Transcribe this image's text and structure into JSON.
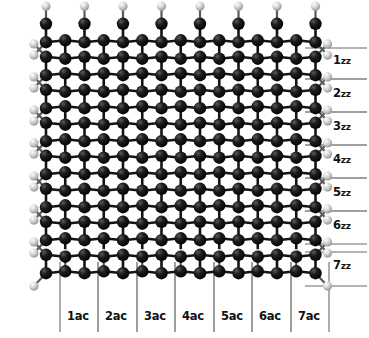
{
  "figure": {
    "type": "molecular-structure-diagram",
    "background_color": "#ffffff"
  },
  "colors": {
    "carbon": "#0a0a0a",
    "carbon_highlight": "#6e6e6e",
    "hydrogen": "#d9d9d9",
    "hydrogen_highlight": "#ffffff",
    "hydrogen_shadow": "#8a8a8a",
    "bond_carbon": "#141414",
    "bond_hydrogen": "#5a5a5a",
    "guide_line": "#9a9a9a",
    "label_text": "#111111"
  },
  "lattice": {
    "hex_columns": 7,
    "hex_rows": 7,
    "origin_x": 46,
    "origin_y": 33,
    "bond_length": 22,
    "cell_width": 38.5,
    "cell_height": 33,
    "carbon_radius": 6.2,
    "hydrogen_radius": 4.6,
    "bond_width": 2.6
  },
  "zigzag_axis": {
    "name": "zigzag-direction-axis",
    "unit_suffix": "zz",
    "label_x": 333,
    "guide_line_x_start": 305,
    "guide_line_x_end": 367,
    "labels": [
      {
        "index": 1,
        "text": "1",
        "sub": "zz",
        "y": 60,
        "line_top_y": 48,
        "line_bottom_y": 79
      },
      {
        "index": 2,
        "text": "2",
        "sub": "zz",
        "y": 93,
        "line_top_y": 79,
        "line_bottom_y": 112
      },
      {
        "index": 3,
        "text": "3",
        "sub": "zz",
        "y": 126,
        "line_top_y": 112,
        "line_bottom_y": 145
      },
      {
        "index": 4,
        "text": "4",
        "sub": "zz",
        "y": 159,
        "line_top_y": 145,
        "line_bottom_y": 178
      },
      {
        "index": 5,
        "text": "5",
        "sub": "zz",
        "y": 192,
        "line_top_y": 178,
        "line_bottom_y": 211
      },
      {
        "index": 6,
        "text": "6",
        "sub": "zz",
        "y": 225,
        "line_top_y": 211,
        "line_bottom_y": 244
      },
      {
        "index": 7,
        "text": "7",
        "sub": "zz",
        "y": 265,
        "line_top_y": 252,
        "line_bottom_y": 286
      }
    ]
  },
  "armchair_axis": {
    "name": "armchair-direction-axis",
    "unit_suffix": "ac",
    "label_y": 316,
    "guide_line_y_start": 262,
    "guide_line_y_end": 332,
    "labels": [
      {
        "index": 1,
        "text": "1ac",
        "x": 78,
        "line_left_x": 60,
        "line_right_x": 98
      },
      {
        "index": 2,
        "text": "2ac",
        "x": 116,
        "line_left_x": 98,
        "line_right_x": 137
      },
      {
        "index": 3,
        "text": "3ac",
        "x": 155,
        "line_left_x": 137,
        "line_right_x": 175
      },
      {
        "index": 4,
        "text": "4ac",
        "x": 193,
        "line_left_x": 175,
        "line_right_x": 214
      },
      {
        "index": 5,
        "text": "5ac",
        "x": 232,
        "line_left_x": 214,
        "line_right_x": 252
      },
      {
        "index": 6,
        "text": "6ac",
        "x": 270,
        "line_left_x": 252,
        "line_right_x": 291
      },
      {
        "index": 7,
        "text": "7ac",
        "x": 309,
        "line_left_x": 291,
        "line_right_x": 329
      }
    ]
  },
  "atoms": {
    "carbon_label": "C",
    "hydrogen_label": "H",
    "edge_hydrogen_counts": {
      "top": 7,
      "bottom": 7,
      "left": 8,
      "right": 8
    }
  }
}
